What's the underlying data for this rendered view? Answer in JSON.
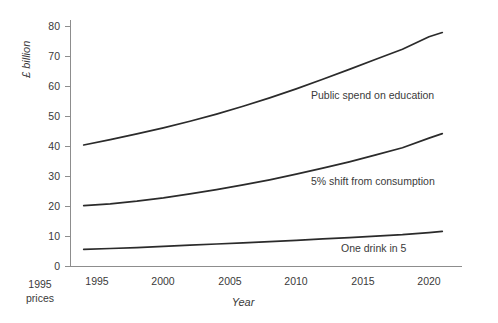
{
  "chart_data": {
    "type": "line",
    "title": "",
    "xlabel": "Year",
    "ylabel": "£ billion",
    "xlim": [
      1994,
      2021
    ],
    "ylim": [
      0,
      80
    ],
    "xticks": [
      1995,
      2000,
      2005,
      2010,
      2015,
      2020
    ],
    "xtick_labels": [
      "1995",
      "2000",
      "2005",
      "2010",
      "2015",
      "2020"
    ],
    "yticks": [
      0,
      10,
      20,
      30,
      40,
      50,
      60,
      70,
      80
    ],
    "ytick_labels": [
      "0",
      "10",
      "20",
      "30",
      "40",
      "50",
      "60",
      "70",
      "80"
    ],
    "grid": false,
    "legend_position": "inline-annotations",
    "note": "1995 prices",
    "note_line1": "1995",
    "note_line2": "prices",
    "x": [
      1994,
      1996,
      1998,
      2000,
      2002,
      2004,
      2006,
      2008,
      2010,
      2012,
      2014,
      2016,
      2018,
      2020,
      2021
    ],
    "series": [
      {
        "name": "Public spend on education",
        "label": "Public spend on education",
        "color": "#2b2b2b",
        "values": [
          40.5,
          42.3,
          44.2,
          46.2,
          48.4,
          50.8,
          53.4,
          56.2,
          59.2,
          62.4,
          65.7,
          69.1,
          72.4,
          76.6,
          78.0
        ]
      },
      {
        "name": "5% shift from consumption",
        "label": "5% shift from consumption",
        "color": "#2b2b2b",
        "values": [
          20.3,
          20.9,
          21.8,
          22.9,
          24.2,
          25.6,
          27.2,
          28.9,
          30.8,
          32.8,
          34.9,
          37.2,
          39.6,
          42.8,
          44.3
        ]
      },
      {
        "name": "One drink in 5",
        "label": "One drink in 5",
        "color": "#2b2b2b",
        "values": [
          5.7,
          6.0,
          6.3,
          6.7,
          7.1,
          7.5,
          7.9,
          8.3,
          8.7,
          9.2,
          9.6,
          10.1,
          10.6,
          11.3,
          11.7
        ]
      }
    ],
    "annotations": [
      {
        "text": "Public spend on education",
        "x": 2008.0,
        "y": 57.5
      },
      {
        "text": "5% shift from consumption",
        "x": 2008.0,
        "y": 29.0
      },
      {
        "text": "One drink in 5",
        "x": 2011.5,
        "y": 7.2
      }
    ]
  }
}
